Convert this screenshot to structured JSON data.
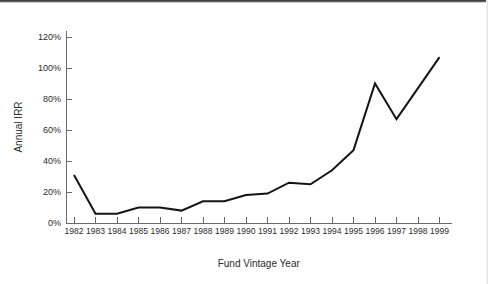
{
  "chart_data": {
    "type": "line",
    "title": "",
    "xlabel": "Fund Vintage Year",
    "ylabel": "Annual IRR",
    "x": [
      1982,
      1983,
      1984,
      1985,
      1986,
      1987,
      1988,
      1989,
      1990,
      1991,
      1992,
      1993,
      1994,
      1995,
      1996,
      1997,
      1998,
      1999
    ],
    "categories": [
      "1982",
      "1983",
      "1984",
      "1985",
      "1986",
      "1987",
      "1988",
      "1989",
      "1990",
      "1991",
      "1992",
      "1993",
      "1994",
      "1995",
      "1996",
      "1997",
      "1998",
      "1999"
    ],
    "values": [
      31,
      6,
      6,
      10,
      10,
      8,
      14,
      14,
      18,
      19,
      26,
      25,
      34,
      47,
      90,
      67,
      87,
      107
    ],
    "series": [
      {
        "name": "Annual IRR",
        "values": [
          31,
          6,
          6,
          10,
          10,
          8,
          14,
          14,
          18,
          19,
          26,
          25,
          34,
          47,
          90,
          67,
          87,
          107
        ]
      }
    ],
    "ylim": [
      0,
      120
    ],
    "ytick_values": [
      0,
      20,
      40,
      60,
      80,
      100,
      120
    ],
    "ytick_labels": [
      "0%",
      "20%",
      "40%",
      "60%",
      "80%",
      "100%",
      "120%"
    ],
    "grid": false,
    "legend": false,
    "legend_position": "none",
    "line_color": "#141414",
    "axis_color": "#6b6b6b"
  }
}
